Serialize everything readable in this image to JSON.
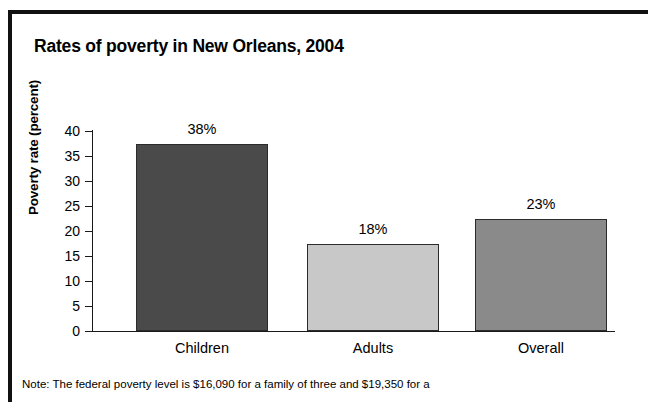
{
  "chart_data": {
    "type": "bar",
    "title": "Rates of poverty in New Orleans, 2004",
    "xlabel": "",
    "ylabel": "Poverty rate (percent)",
    "categories": [
      "Children",
      "Adults",
      "Overall"
    ],
    "values": [
      37.5,
      17.5,
      22.5
    ],
    "data_labels": [
      "38%",
      "18%",
      "23%"
    ],
    "ylim": [
      0,
      40
    ],
    "ytick_labels": [
      "40",
      "35",
      "30",
      "25",
      "20",
      "15",
      "10",
      "5",
      "0"
    ],
    "ytick_values": [
      40,
      35,
      30,
      25,
      20,
      15,
      10,
      5,
      0
    ],
    "grid": false,
    "legend": "none",
    "bar_colors": [
      "#4a4a4a",
      "#c8c8c8",
      "#8a8a8a"
    ],
    "note": "Note: The federal poverty level is $16,090 for a family of three and $19,350 for a"
  },
  "colors": {
    "frame": "#111111",
    "axis": "#1a1a1a",
    "text": "#000000",
    "background": "#ffffff"
  }
}
